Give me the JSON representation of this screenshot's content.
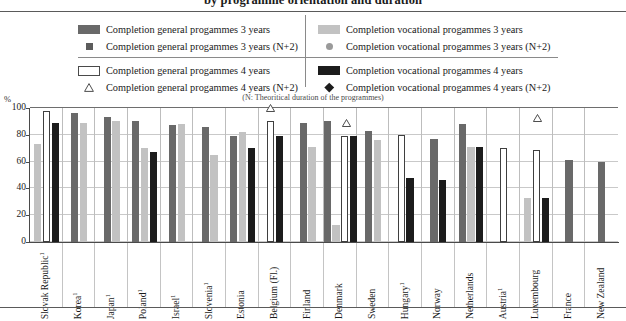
{
  "title": "by programme orientation and duration",
  "axis_note": "(N: Theoritical duration of  the programmes)",
  "percent_symbol": "%",
  "legend": {
    "items": [
      {
        "id": "gen3",
        "label": "Completion general progammes 3 years",
        "marker": "bar-dark-gray",
        "color": "#696969"
      },
      {
        "id": "gen3n2",
        "label": "Completion general progammes 3 years (N+2)",
        "marker": "square",
        "color": "#5c5c5c"
      },
      {
        "id": "voc3",
        "label": "Completion vocational progammes 3 years",
        "marker": "bar-light-gray",
        "color": "#c2c2c2"
      },
      {
        "id": "voc3n2",
        "label": "Completion vocational progammes 3 years (N+2)",
        "marker": "circle",
        "color": "#9a9a9a"
      },
      {
        "id": "gen4",
        "label": "Completion general progammes 4 years",
        "marker": "bar-white",
        "color": "#ffffff"
      },
      {
        "id": "gen4n2",
        "label": "Completion general progammes 4 years (N+2)",
        "marker": "triangle",
        "color": "#ffffff"
      },
      {
        "id": "voc4",
        "label": "Completion vocational progammes 4 years",
        "marker": "bar-black",
        "color": "#1c1c1c"
      },
      {
        "id": "voc4n2",
        "label": "Completion vocational progammes 4 years (N+2)",
        "marker": "diamond",
        "color": "#1c1c1c"
      }
    ]
  },
  "chart_data": {
    "type": "bar",
    "title": "by programme orientation and duration",
    "xlabel": "",
    "ylabel": "%",
    "ylim": [
      0,
      100
    ],
    "yticks": [
      0,
      20,
      40,
      60,
      80,
      100
    ],
    "grid": true,
    "legend_position": "top",
    "categories": [
      "Slovak Republic¹",
      "Korea¹",
      "Japan¹",
      "Poland¹",
      "Israel¹",
      "Slovenia¹",
      "Estonia",
      "Belgium (Fl.)",
      "Finland",
      "Denmark",
      "Sweden",
      "Hungary¹",
      "Norway",
      "Netherlands",
      "Austria¹",
      "Luxembourg",
      "France",
      "New Zealand"
    ],
    "category_footnotes": {
      "Slovak Republic¹": "1",
      "Korea¹": "1",
      "Japan¹": "1",
      "Poland¹": "1",
      "Israel¹": "1",
      "Slovenia¹": "1",
      "Hungary¹": "1",
      "Austria¹": "1"
    },
    "series": [
      {
        "name": "Completion general progammes 3 years",
        "key": "gen3",
        "type": "bar",
        "color": "#696969",
        "values": [
          null,
          96,
          93.5,
          90,
          87,
          86,
          79,
          null,
          89,
          90,
          83,
          null,
          77,
          88,
          null,
          null,
          61,
          60
        ]
      },
      {
        "name": "Completion general progammes 3 years (N+2)",
        "key": "gen3n2",
        "type": "marker",
        "color": "#5c5c5c",
        "values": [
          null,
          null,
          null,
          null,
          null,
          null,
          90,
          null,
          90,
          92,
          86,
          null,
          82,
          95,
          null,
          null,
          89,
          70
        ]
      },
      {
        "name": "Completion vocational progammes 3 years",
        "key": "voc3",
        "type": "bar",
        "color": "#c2c2c2",
        "values": [
          73,
          89,
          90.5,
          70,
          88,
          65,
          82,
          null,
          71,
          13,
          76,
          null,
          null,
          71,
          null,
          33,
          null,
          null
        ]
      },
      {
        "name": "Completion vocational progammes 3 years (N+2)",
        "key": "voc3n2",
        "type": "marker",
        "color": "#9a9a9a",
        "values": [
          null,
          null,
          null,
          null,
          null,
          null,
          75,
          null,
          83,
          46,
          81,
          null,
          null,
          83,
          null,
          65,
          null,
          null
        ]
      },
      {
        "name": "Completion general progammes 4 years",
        "key": "gen4",
        "type": "bar",
        "color": "#ffffff",
        "values": [
          98,
          null,
          null,
          null,
          null,
          null,
          null,
          90,
          null,
          79,
          null,
          80,
          null,
          null,
          70,
          69,
          null,
          null
        ]
      },
      {
        "name": "Completion general progammes 4 years (N+2)",
        "key": "gen4n2",
        "type": "marker",
        "color": "#ffffff",
        "values": [
          null,
          null,
          null,
          null,
          null,
          null,
          null,
          96,
          null,
          85,
          null,
          null,
          null,
          null,
          null,
          89,
          null,
          null
        ]
      },
      {
        "name": "Completion vocational progammes 4 years",
        "key": "voc4",
        "type": "bar",
        "color": "#1c1c1c",
        "values": [
          89,
          null,
          null,
          67,
          null,
          null,
          70,
          79,
          null,
          79,
          null,
          48,
          46,
          71,
          null,
          33,
          null,
          null
        ]
      },
      {
        "name": "Completion vocational progammes 4 years (N+2)",
        "key": "voc4n2",
        "type": "marker",
        "color": "#1c1c1c",
        "values": [
          null,
          null,
          null,
          null,
          null,
          null,
          76,
          86,
          null,
          92,
          null,
          null,
          72,
          91,
          null,
          78,
          null,
          null
        ]
      }
    ]
  },
  "layout": {
    "group_width_px": 32.6,
    "plot_left_px": 30,
    "plot_width_px": 588,
    "plot_height_px": 134,
    "baseline_top_px": 242,
    "top_px": 108
  }
}
